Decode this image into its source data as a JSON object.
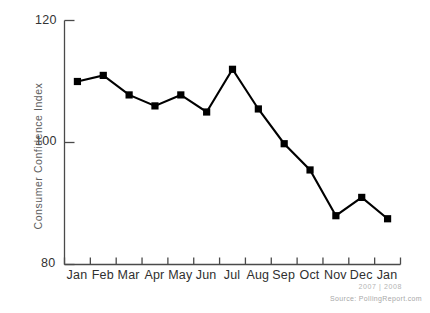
{
  "chart_data": {
    "type": "line",
    "title": "",
    "subtitle": "",
    "xlabel": "",
    "ylabel": "Consumer Confidence Index",
    "ylim": [
      80,
      120
    ],
    "ytick_labels": [
      "120",
      "100",
      "80"
    ],
    "ytick_values": [
      120,
      100,
      80
    ],
    "grid": false,
    "legend": "none",
    "marker": "square",
    "line_color": "#000000",
    "marker_color": "#000000",
    "categories": [
      "Jan",
      "Feb",
      "Mar",
      "Apr",
      "May",
      "Jun",
      "Jul",
      "Aug",
      "Sep",
      "Oct",
      "Nov",
      "Dec",
      "Jan"
    ],
    "values": [
      110.0,
      111.0,
      107.8,
      106.0,
      107.8,
      105.0,
      112.0,
      105.5,
      99.8,
      95.5,
      88.0,
      91.0,
      87.5
    ],
    "series": [
      {
        "name": "Consumer Confidence Index",
        "values": [
          110.0,
          111.0,
          107.8,
          106.0,
          107.8,
          105.0,
          112.0,
          105.5,
          99.8,
          95.5,
          88.0,
          91.0,
          87.5
        ]
      }
    ],
    "annotations": {
      "year_span": "2007 | 2008",
      "source": "Source: PollingReport.com"
    }
  },
  "axis": {
    "y_title": "Consumer Confidence Index",
    "y_ticks": [
      "120",
      "100",
      "80"
    ],
    "x_ticks": [
      "Jan",
      "Feb",
      "Mar",
      "Apr",
      "May",
      "Jun",
      "Jul",
      "Aug",
      "Sep",
      "Oct",
      "Nov",
      "Dec",
      "Jan"
    ]
  },
  "footer": {
    "year_span": "2007 | 2008",
    "source": "Source: PollingReport.com"
  },
  "colors": {
    "line": "#000000",
    "axis": "#4a4a4a",
    "tick_text": "#2f2f2f",
    "axis_title": "#5d5d5d",
    "footer_text": "#a8a8a8",
    "background": "#ffffff"
  }
}
